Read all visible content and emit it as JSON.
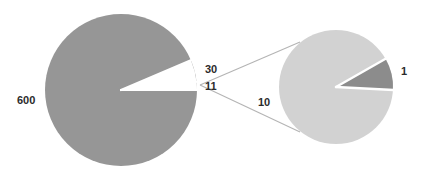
{
  "chart_data": {
    "type": "pie",
    "variant": "pie-of-pie",
    "title": "",
    "subtitle": "",
    "xlabel": "",
    "ylabel": "",
    "legend": null,
    "grid": false,
    "data_labels": true,
    "primary": {
      "name": "Main pie",
      "categories": [
        "600",
        "30",
        "11"
      ],
      "values": [
        600,
        30,
        11
      ],
      "labels": [
        "600",
        "30",
        "11"
      ],
      "colors": [
        "#969696",
        "#ffffff",
        "#ffffff"
      ],
      "total": 641,
      "start_angle_deg": 0,
      "direction": "clockwise",
      "center": [
        121,
        90
      ],
      "radius": 76
    },
    "secondary": {
      "name": "Breakout pie",
      "source_category": "11",
      "categories": [
        "10",
        "1"
      ],
      "values": [
        10,
        1
      ],
      "labels": [
        "10",
        "1"
      ],
      "colors": [
        "#d2d2d2",
        "#8c8c8c"
      ],
      "total": 11,
      "center": [
        336,
        87
      ],
      "radius": 57
    },
    "connectors": {
      "apex": [
        200,
        85
      ],
      "top_target": [
        300,
        42
      ],
      "bottom_target": [
        300,
        132
      ],
      "color": "#b4b4b4"
    }
  },
  "labels": {
    "main": [
      {
        "id": "label-main-0",
        "text": "600"
      },
      {
        "id": "label-main-1",
        "text": "30"
      },
      {
        "id": "label-main-2",
        "text": "11"
      }
    ],
    "secondary": [
      {
        "id": "label-sec-0",
        "text": "10"
      },
      {
        "id": "label-sec-1",
        "text": "1"
      }
    ]
  },
  "colors": {
    "background": "#ffffff",
    "main_slice": "#969696",
    "secondary_large": "#d2d2d2",
    "secondary_small": "#8c8c8c",
    "separator": "#ffffff",
    "connector": "#b4b4b4",
    "label_text": "#2b2b2b"
  }
}
